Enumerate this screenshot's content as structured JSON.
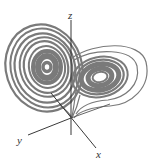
{
  "figure": {
    "colors": {
      "trajectory": "#7a7a7a",
      "axis": "#222222",
      "background": "#ffffff"
    },
    "axes": {
      "x_label": "x",
      "y_label": "y",
      "z_label": "z"
    },
    "lobes": [
      {
        "name": "left-lobe",
        "cx": 47,
        "cy": 67
      },
      {
        "name": "right-lobe",
        "cx": 100,
        "cy": 77
      }
    ]
  }
}
